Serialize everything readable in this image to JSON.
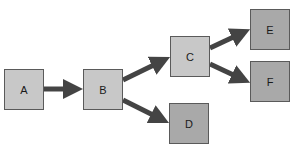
{
  "diagram": {
    "type": "flowchart",
    "colors": {
      "background": "#ffffff",
      "light_node": "#c8c8c8",
      "dark_node": "#a9a9a9",
      "border": "#5a5a5a",
      "arrow": "#444444"
    },
    "nodes": [
      {
        "id": "A",
        "label": "A",
        "shade": "light"
      },
      {
        "id": "B",
        "label": "B",
        "shade": "light"
      },
      {
        "id": "C",
        "label": "C",
        "shade": "light"
      },
      {
        "id": "D",
        "label": "D",
        "shade": "dark"
      },
      {
        "id": "E",
        "label": "E",
        "shade": "dark"
      },
      {
        "id": "F",
        "label": "F",
        "shade": "dark"
      }
    ],
    "edges": [
      {
        "from": "A",
        "to": "B"
      },
      {
        "from": "B",
        "to": "C"
      },
      {
        "from": "B",
        "to": "D"
      },
      {
        "from": "C",
        "to": "E"
      },
      {
        "from": "C",
        "to": "F"
      }
    ]
  }
}
